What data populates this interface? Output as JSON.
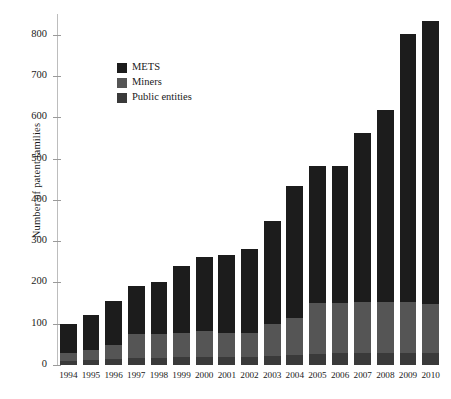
{
  "chart_data": {
    "type": "bar",
    "subtype": "stacked-vertical",
    "title": "",
    "xlabel": "",
    "ylabel": "Number of patent families",
    "ylim": [
      0,
      850
    ],
    "yticks": [
      0,
      100,
      200,
      300,
      400,
      500,
      600,
      700,
      800
    ],
    "ytick_labels": [
      "0",
      "100",
      "200",
      "300",
      "400",
      "500",
      "600",
      "700",
      "800"
    ],
    "grid": false,
    "legend_position": "upper-left-inside",
    "categories": [
      "1994",
      "1995",
      "1996",
      "1997",
      "1998",
      "1999",
      "2000",
      "2001",
      "2002",
      "2003",
      "2004",
      "2005",
      "2006",
      "2007",
      "2008",
      "2009",
      "2010"
    ],
    "series": [
      {
        "name": "Public entities",
        "color": "#3a3a3a",
        "values": [
          10,
          12,
          14,
          16,
          18,
          20,
          20,
          20,
          20,
          22,
          24,
          26,
          28,
          30,
          30,
          30,
          30
        ]
      },
      {
        "name": "Miners",
        "color": "#555555",
        "values": [
          18,
          25,
          35,
          58,
          58,
          58,
          62,
          58,
          58,
          78,
          90,
          124,
          122,
          122,
          122,
          122,
          117
        ]
      },
      {
        "name": "METS",
        "color": "#1c1c1c",
        "values": [
          72,
          85,
          107,
          117,
          126,
          163,
          180,
          188,
          204,
          248,
          320,
          331,
          332,
          410,
          466,
          650,
          685
        ]
      }
    ],
    "totals": [
      100,
      122,
      156,
      191,
      202,
      241,
      262,
      266,
      282,
      348,
      434,
      481,
      482,
      562,
      618,
      802,
      832
    ]
  },
  "legend": {
    "items": [
      {
        "label": "METS",
        "color": "#1c1c1c"
      },
      {
        "label": "Miners",
        "color": "#555555"
      },
      {
        "label": "Public entities",
        "color": "#3a3a3a"
      }
    ]
  }
}
